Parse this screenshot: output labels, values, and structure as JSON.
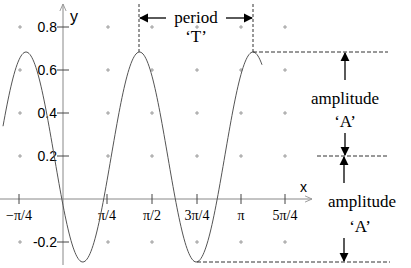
{
  "figure": {
    "axes": {
      "x_label": "x",
      "y_label": "y",
      "x_ticks": [
        {
          "label": "−π/4",
          "px": 19
        },
        {
          "label": "π/4",
          "px": 107
        },
        {
          "label": "π/2",
          "px": 152
        },
        {
          "label": "3π/4",
          "px": 197
        },
        {
          "label": "π",
          "px": 241
        },
        {
          "label": "5π/4",
          "px": 285
        }
      ],
      "y_ticks": [
        {
          "label": "0.8",
          "py": 27
        },
        {
          "label": "0.6",
          "py": 70
        },
        {
          "label": "0.4",
          "py": 113
        },
        {
          "label": "0.2",
          "py": 156
        },
        {
          "label": "-0.2",
          "py": 242
        }
      ]
    },
    "annotations": {
      "period_label": "period",
      "period_symbol": "‘T’",
      "amplitude_upper_label": "amplitude",
      "amplitude_upper_symbol": "‘A’",
      "amplitude_lower_label": "amplitude",
      "amplitude_lower_symbol": "‘A’"
    },
    "curve": {
      "type": "cosine",
      "center_value": 0.195,
      "amplitude_value": 0.485,
      "max_value": 0.68,
      "min_value": -0.29,
      "color": "#555555"
    }
  },
  "chart_data": {
    "type": "line",
    "title": "",
    "xlabel": "x",
    "ylabel": "y",
    "x_tick_labels": [
      "−π/4",
      "π/4",
      "π/2",
      "3π/4",
      "π",
      "5π/4"
    ],
    "y_tick_labels": [
      "0.8",
      "0.6",
      "0.4",
      "0.2",
      "-0.2"
    ],
    "ylim": [
      -0.3,
      0.9
    ],
    "xlim_approx": [
      -1.05,
      4.4
    ],
    "series": [
      {
        "name": "y = 0.195 + 0.485 cos(k(x - x0))",
        "peaks_x_approx": [
          -0.65,
          1.36,
          3.37
        ],
        "troughs_x_approx": [
          0.35,
          2.37
        ],
        "max": 0.68,
        "min": -0.29
      }
    ],
    "annotations": [
      "period 'T'",
      "amplitude 'A'",
      "amplitude 'A'"
    ],
    "grid": "plus-marks"
  }
}
